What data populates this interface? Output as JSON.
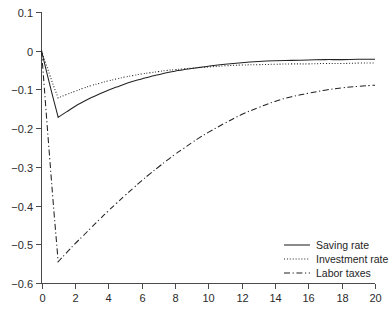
{
  "chart_data": {
    "type": "line",
    "title": "",
    "subtitle": "",
    "xlabel": "",
    "ylabel": "",
    "xlim": [
      0,
      20
    ],
    "ylim": [
      -0.6,
      0.1
    ],
    "grid": false,
    "legend_position": "bottom-right",
    "xticks": [
      0,
      2,
      4,
      6,
      8,
      10,
      12,
      14,
      16,
      18,
      20
    ],
    "xticklabels": [
      "0",
      "2",
      "4",
      "6",
      "8",
      "10",
      "12",
      "14",
      "16",
      "18",
      "20"
    ],
    "yticks": [
      0.1,
      0,
      -0.1,
      -0.2,
      -0.3,
      -0.4,
      -0.5,
      -0.6
    ],
    "yticklabels": [
      "0.1",
      "0",
      "-0.1",
      "-0.2",
      "-0.3",
      "-0.4",
      "-0.5",
      "-0.6"
    ],
    "x": [
      0,
      0.25,
      0.5,
      0.75,
      1,
      1.5,
      2,
      2.5,
      3,
      3.5,
      4,
      4.5,
      5,
      5.5,
      6,
      6.5,
      7,
      7.5,
      8,
      8.5,
      9,
      9.5,
      10,
      11,
      12,
      13,
      14,
      15,
      16,
      17,
      18,
      19,
      20
    ],
    "series": [
      {
        "name": "Saving rate",
        "style": "solid",
        "color": "#222222",
        "values": [
          0,
          -0.045,
          -0.088,
          -0.131,
          -0.172,
          -0.158,
          -0.144,
          -0.132,
          -0.121,
          -0.111,
          -0.102,
          -0.094,
          -0.086,
          -0.079,
          -0.073,
          -0.067,
          -0.062,
          -0.057,
          -0.053,
          -0.049,
          -0.046,
          -0.043,
          -0.04,
          -0.035,
          -0.031,
          -0.028,
          -0.026,
          -0.025,
          -0.024,
          -0.023,
          -0.023,
          -0.022,
          -0.022
        ]
      },
      {
        "name": "Investment rate",
        "style": "dotted",
        "color": "#222222",
        "values": [
          0,
          -0.032,
          -0.063,
          -0.094,
          -0.122,
          -0.113,
          -0.105,
          -0.097,
          -0.09,
          -0.084,
          -0.078,
          -0.073,
          -0.068,
          -0.064,
          -0.06,
          -0.057,
          -0.054,
          -0.051,
          -0.049,
          -0.047,
          -0.045,
          -0.043,
          -0.042,
          -0.039,
          -0.037,
          -0.036,
          -0.035,
          -0.034,
          -0.034,
          -0.033,
          -0.033,
          -0.032,
          -0.032
        ]
      },
      {
        "name": "Labor taxes",
        "style": "dashdot",
        "color": "#222222",
        "values": [
          0,
          -0.142,
          -0.282,
          -0.418,
          -0.545,
          -0.522,
          -0.499,
          -0.478,
          -0.456,
          -0.435,
          -0.414,
          -0.394,
          -0.374,
          -0.355,
          -0.336,
          -0.318,
          -0.301,
          -0.284,
          -0.268,
          -0.253,
          -0.238,
          -0.224,
          -0.211,
          -0.187,
          -0.165,
          -0.147,
          -0.131,
          -0.119,
          -0.11,
          -0.102,
          -0.096,
          -0.092,
          -0.089
        ]
      }
    ],
    "legend": [
      {
        "label": "Saving rate",
        "style": "solid"
      },
      {
        "label": "Investment rate",
        "style": "dotted"
      },
      {
        "label": "Labor taxes",
        "style": "dashdot"
      }
    ]
  }
}
